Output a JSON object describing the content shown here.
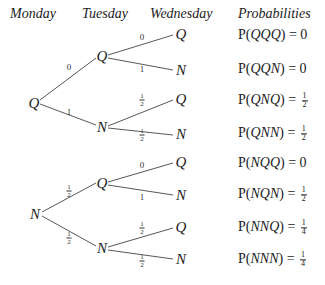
{
  "headers": {
    "monday": "Monday",
    "tuesday": "Tuesday",
    "wednesday": "Wednesday",
    "probabilities": "Probabilities"
  },
  "tree": {
    "roots": [
      {
        "label": "Q",
        "children": [
          {
            "label": "Q",
            "edge": "0",
            "children": [
              {
                "label": "Q",
                "edge": "0"
              },
              {
                "label": "N",
                "edge": "1"
              }
            ]
          },
          {
            "label": "N",
            "edge": "1",
            "children": [
              {
                "label": "Q",
                "edge": "1/2"
              },
              {
                "label": "N",
                "edge": "1/2"
              }
            ]
          }
        ]
      },
      {
        "label": "N",
        "children": [
          {
            "label": "Q",
            "edge": "1/2",
            "children": [
              {
                "label": "Q",
                "edge": "0"
              },
              {
                "label": "N",
                "edge": "1"
              }
            ]
          },
          {
            "label": "N",
            "edge": "1/2",
            "children": [
              {
                "label": "Q",
                "edge": "1/2"
              },
              {
                "label": "N",
                "edge": "1/2"
              }
            ]
          }
        ]
      }
    ]
  },
  "probabilities": [
    {
      "seq": "QQQ",
      "value": "0"
    },
    {
      "seq": "QQN",
      "value": "0"
    },
    {
      "seq": "QNQ",
      "value": "1/2"
    },
    {
      "seq": "QNN",
      "value": "1/2"
    },
    {
      "seq": "NQQ",
      "value": "0"
    },
    {
      "seq": "NQN",
      "value": "1/2"
    },
    {
      "seq": "NNQ",
      "value": "1/4"
    },
    {
      "seq": "NNN",
      "value": "1/4"
    }
  ],
  "labels": {
    "Q": "Q",
    "N": "N",
    "zero": "0",
    "one": "1",
    "two": "2",
    "four": "4",
    "p_prefix": "P(",
    "p_suffix": ") = "
  }
}
